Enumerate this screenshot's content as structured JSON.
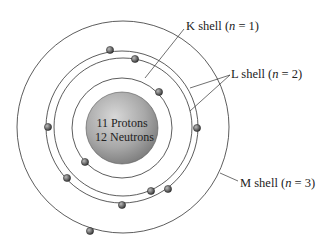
{
  "nucleus": {
    "line1": "11 Protons",
    "line2": "12 Neutrons"
  },
  "labels": {
    "k": {
      "prefix": "K shell (",
      "var": "n",
      "suffix": " = 1)"
    },
    "l": {
      "prefix": "L shell (",
      "var": "n",
      "suffix": " = 2)"
    },
    "m": {
      "prefix": "M shell (",
      "var": "n",
      "suffix": " = 3)"
    }
  }
}
